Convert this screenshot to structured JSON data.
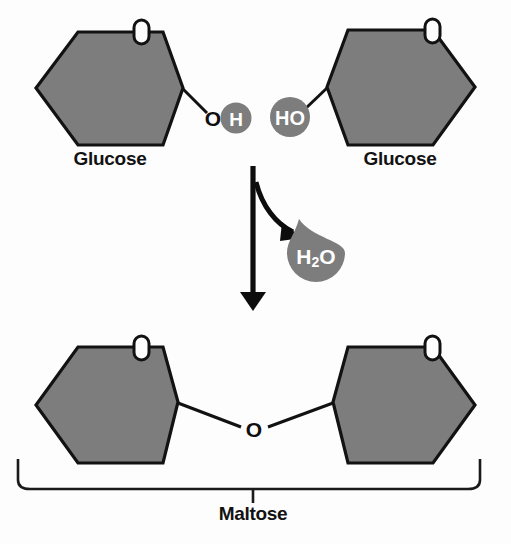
{
  "diagram": {
    "labels": {
      "glucose_left": "Glucose",
      "glucose_right": "Glucose",
      "product": "Maltose"
    },
    "reactants": [
      {
        "name": "Glucose",
        "ring_oxygen_label": "O",
        "functional_group_label": "OH",
        "functional_group_parts": {
          "oxygen": "O",
          "hydrogen": "H"
        },
        "side": "left"
      },
      {
        "name": "Glucose",
        "ring_oxygen_label": "O",
        "functional_group_label": "HO",
        "side": "right"
      }
    ],
    "byproduct": {
      "formula": "H2O",
      "formula_parts": {
        "lead": "H",
        "subscript": "2",
        "trail": "O"
      },
      "shape": "water-droplet"
    },
    "product": {
      "name": "Maltose",
      "glycosidic_bond_label": "O",
      "ring_oxygen_labels": [
        "O",
        "O"
      ]
    },
    "colors": {
      "ring_fill": "#7d7d7d",
      "outline": "#121212",
      "atom_text_light": "#ffffff",
      "atom_text_dark": "#0f0f0f",
      "background": "#fdfdfd"
    }
  }
}
